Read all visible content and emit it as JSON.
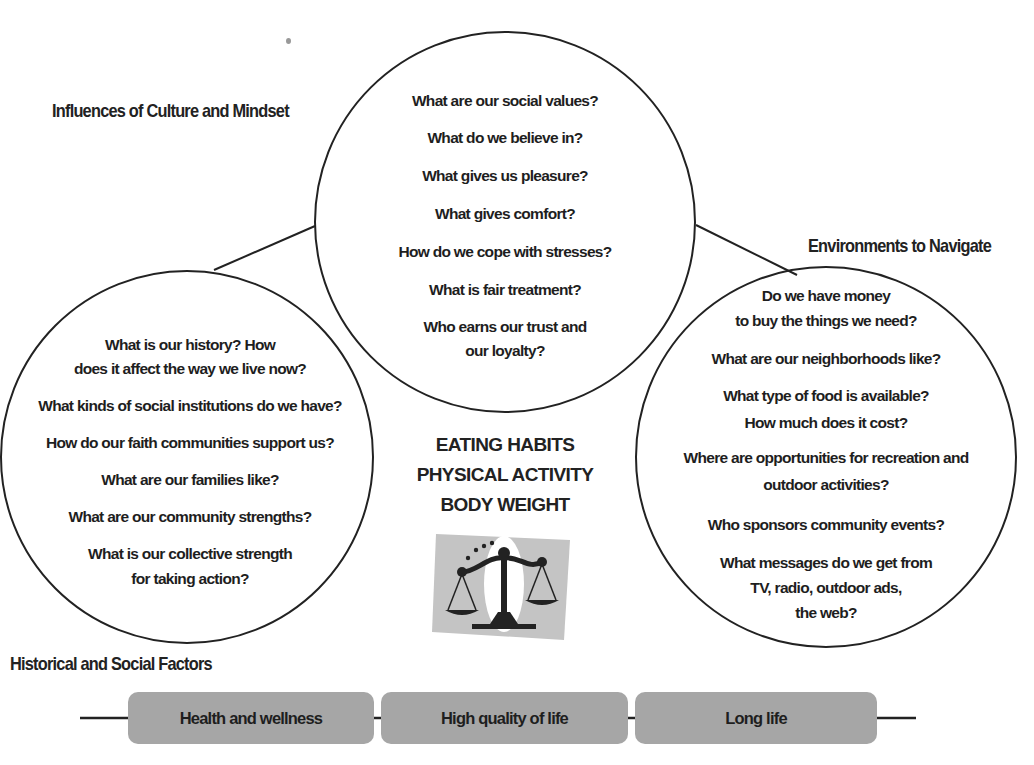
{
  "diagram": {
    "headings": {
      "culture": "Influences of Culture and Mindset",
      "environments": "Environments to Navigate",
      "historical": "Historical and Social Factors"
    },
    "culture_circle": {
      "questions": [
        "What are our social values?",
        "What do we believe in?",
        "What gives us pleasure?",
        "What gives comfort?",
        "How do we cope with stresses?",
        "What is fair treatment?",
        "Who earns our trust and",
        "our loyalty?"
      ]
    },
    "historical_circle": {
      "questions": [
        "What is our history? How",
        "does it affect the way we live now?",
        "What kinds of social institutions do we have?",
        "How do our faith communities support us?",
        "What are our families like?",
        "What are our community strengths?",
        "What is our collective strength",
        "for taking action?"
      ]
    },
    "environments_circle": {
      "questions": [
        "Do we have money",
        "to buy the things we need?",
        "What are our neighborhoods like?",
        "What type of food is available?",
        "How much does it cost?",
        "Where are opportunities for recreation and",
        "outdoor activities?",
        "Who sponsors community events?",
        "What messages do we get from",
        "TV, radio, outdoor ads,",
        "the web?"
      ]
    },
    "center": {
      "lines": [
        "EATING HABITS",
        "PHYSICAL ACTIVITY",
        "BODY WEIGHT"
      ],
      "icon": "balance-scale-icon"
    },
    "outcomes": [
      {
        "label": "Health and wellness"
      },
      {
        "label": "High quality of life"
      },
      {
        "label": "Long life"
      }
    ],
    "colors": {
      "stroke": "#222222",
      "pill_fill": "#a6a6a6",
      "scale_bg": "#c4c4c4",
      "text": "#1e1e1e"
    }
  }
}
